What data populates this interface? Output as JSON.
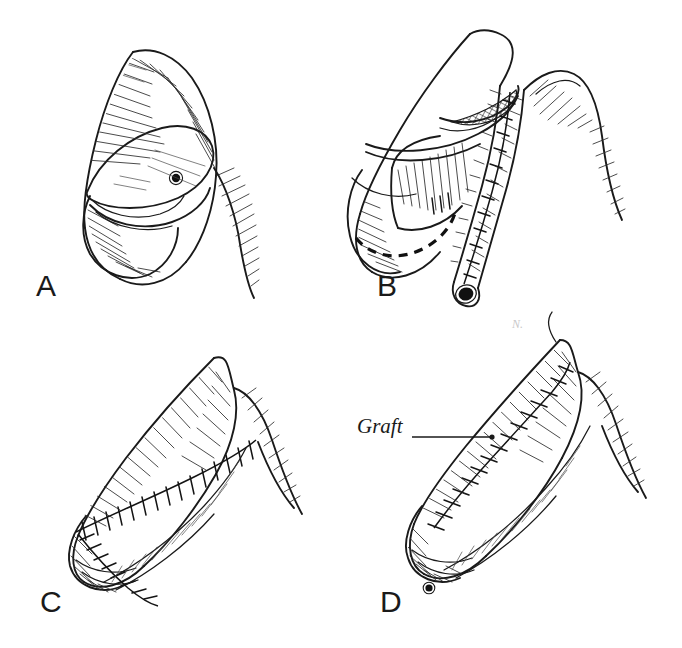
{
  "figure": {
    "medium": "pen-and-ink hatched drawing",
    "background_color": "#ffffff",
    "ink_color": "#1a1a1a",
    "width": 682,
    "height": 648
  },
  "panels": [
    {
      "id": "A",
      "letter": "A",
      "letter_x": 36,
      "letter_y": 296,
      "caption": "Elliptical outline marked on the dorsal shaft skin indicating the donor graft site; retracted foreskin edge exposed below",
      "features": [
        "elliptical-incision-outline",
        "meatus-dot",
        "retracted-skin-edge",
        "hatched-shading"
      ]
    },
    {
      "id": "B",
      "letter": "B",
      "letter_x": 377,
      "letter_y": 296,
      "caption": "Graft tubularized over a catheter and shown detached alongside; cross-hatched recipient bed and dashed coronal marking visible",
      "features": [
        "tubed-graft",
        "graft-open-end-lumen",
        "graft-suture-line",
        "crosshatched-defect-bed",
        "dashed-coronal-marking"
      ]
    },
    {
      "id": "C",
      "letter": "C",
      "letter_x": 40,
      "letter_y": 612,
      "caption": "Completed closure with interrupted sutures running obliquely along the shaft and around the distal margin",
      "features": [
        "interrupted-suture-line",
        "distal-margin-sutures",
        "hatched-shading"
      ]
    },
    {
      "id": "D",
      "letter": "D",
      "letter_x": 380,
      "letter_y": 612,
      "caption": "Final result with the inlaid graft labeled, sutured along its full dorsolateral border",
      "features": [
        "graft-suture-border",
        "graft-callout-label",
        "meatus-dot",
        "hatched-shading"
      ]
    }
  ],
  "annotations": [
    {
      "id": "graft-callout",
      "text": "Graft",
      "panel": "D",
      "text_x": 357,
      "text_y": 433,
      "leader_from_x": 412,
      "leader_from_y": 437,
      "leader_to_x": 492,
      "leader_to_y": 437,
      "style": "handwritten-italic-with-leader-line"
    }
  ],
  "legend": {
    "line_styles": [
      {
        "name": "solid-outline",
        "meaning": "tissue contour"
      },
      {
        "name": "dashed-line",
        "meaning": "planned or hidden margin"
      },
      {
        "name": "tick-marked-line",
        "meaning": "interrupted suture line"
      },
      {
        "name": "cross-hatching",
        "meaning": "raw or de-epithelialized surface"
      }
    ]
  }
}
